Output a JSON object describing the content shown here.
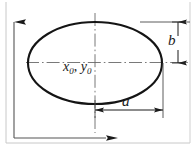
{
  "figure": {
    "type": "engineering-dimension-diagram",
    "background_color": "#ffffff",
    "outline_color": "#1a1a1a",
    "centerline_color": "#5a5a5a",
    "axis_color": "#1a1a1a",
    "frame_color": "#b0b0b0",
    "labels": {
      "center_x": "x",
      "center_x_sub": "0",
      "center_separator": ",",
      "center_y": "y",
      "center_y_sub": "0",
      "center_full": "x0, y0",
      "semi_minor": "b",
      "semi_major": "a"
    },
    "geometry": {
      "ellipse_center_x": 95,
      "ellipse_center_y": 63,
      "ellipse_radius_x": 67,
      "ellipse_radius_y": 41,
      "vertical_axis_x": 14,
      "vertical_axis_top_y": 18,
      "horizontal_axis_y": 138,
      "horizontal_axis_right_x": 112,
      "dim_a_y": 110,
      "dim_a_from_x": 95,
      "dim_a_to_x": 163,
      "dim_b_x": 178,
      "dim_b_from_y": 22,
      "dim_b_to_y": 63
    }
  }
}
